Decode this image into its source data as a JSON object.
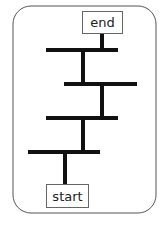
{
  "diagram": {
    "type": "ladder-path",
    "frame": {
      "x": 13,
      "y": 6,
      "width": 143,
      "height": 207,
      "radius": 18,
      "stroke": "#555555"
    },
    "nodes": {
      "end": {
        "label": "end",
        "x": 82,
        "y": 11,
        "width": 40,
        "height": 22
      },
      "start": {
        "label": "start",
        "x": 46,
        "y": 184,
        "width": 42,
        "height": 23
      }
    },
    "rungs": [
      {
        "y": 50,
        "x1": 46,
        "x2": 118
      },
      {
        "y": 84,
        "x1": 64,
        "x2": 137
      },
      {
        "y": 118,
        "x1": 46,
        "x2": 118
      },
      {
        "y": 152,
        "x1": 28,
        "x2": 100
      }
    ],
    "stems": [
      {
        "x": 102,
        "y1": 33,
        "y2": 50
      },
      {
        "x": 83,
        "y1": 50,
        "y2": 84
      },
      {
        "x": 102,
        "y1": 84,
        "y2": 118
      },
      {
        "x": 83,
        "y1": 118,
        "y2": 152
      },
      {
        "x": 65,
        "y1": 152,
        "y2": 184
      }
    ],
    "line_color": "#111111"
  }
}
